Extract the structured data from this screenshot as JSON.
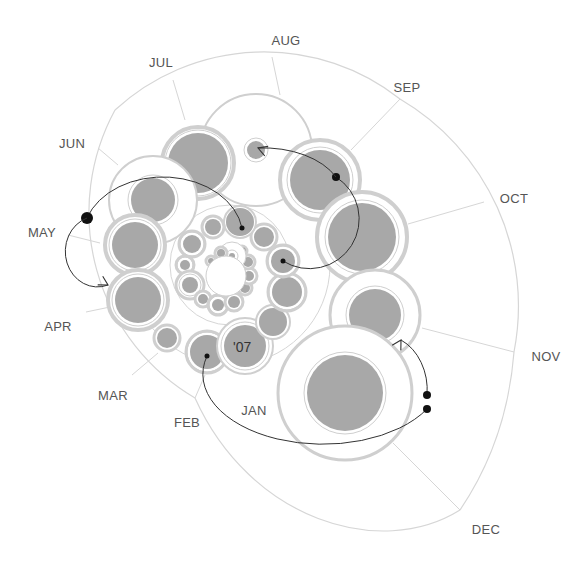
{
  "chart_data": {
    "type": "bubble-spiral",
    "title": "",
    "annotations": [
      "'07"
    ],
    "month_labels": [
      {
        "label": "AUG",
        "x": 286,
        "y": 45
      },
      {
        "label": "JUL",
        "x": 161,
        "y": 67
      },
      {
        "label": "SEP",
        "x": 407,
        "y": 92
      },
      {
        "label": "JUN",
        "x": 72,
        "y": 148
      },
      {
        "label": "OCT",
        "x": 514,
        "y": 203
      },
      {
        "label": "MAY",
        "x": 42,
        "y": 237
      },
      {
        "label": "APR",
        "x": 58,
        "y": 331
      },
      {
        "label": "NOV",
        "x": 546,
        "y": 361
      },
      {
        "label": "MAR",
        "x": 113,
        "y": 400
      },
      {
        "label": "FEB",
        "x": 187,
        "y": 427
      },
      {
        "label": "JAN",
        "x": 254,
        "y": 415
      },
      {
        "label": "DEC",
        "x": 486,
        "y": 534
      }
    ],
    "colors": {
      "fill": "#a8a8a8",
      "ring": "#cfcfcf",
      "grid": "#d6d6d6",
      "arc": "#333333",
      "dot": "#111111",
      "label": "#555555"
    },
    "outer_boundary": {
      "cx": 300,
      "cy": 260,
      "r": 225
    },
    "sector_lines": [
      {
        "x1": 280,
        "y1": 95,
        "x2": 272,
        "y2": 57
      },
      {
        "x1": 185,
        "y1": 120,
        "x2": 173,
        "y2": 80
      },
      {
        "x1": 351,
        "y1": 150,
        "x2": 400,
        "y2": 99
      },
      {
        "x1": 118,
        "y1": 165,
        "x2": 98,
        "y2": 148
      },
      {
        "x1": 408,
        "y1": 224,
        "x2": 484,
        "y2": 202
      },
      {
        "x1": 100,
        "y1": 243,
        "x2": 68,
        "y2": 235
      },
      {
        "x1": 110,
        "y1": 307,
        "x2": 86,
        "y2": 312
      },
      {
        "x1": 422,
        "y1": 328,
        "x2": 514,
        "y2": 352
      },
      {
        "x1": 158,
        "y1": 353,
        "x2": 132,
        "y2": 375
      },
      {
        "x1": 205,
        "y1": 375,
        "x2": 195,
        "y2": 398
      },
      {
        "x1": 393,
        "y1": 443,
        "x2": 460,
        "y2": 510
      }
    ],
    "bubbles": [
      {
        "cx": 256,
        "cy": 150,
        "outer": 56,
        "inner": 9,
        "ring": 2
      },
      {
        "cx": 198,
        "cy": 163,
        "outer": 36,
        "inner": 30,
        "ring": 4
      },
      {
        "cx": 153,
        "cy": 200,
        "outer": 44,
        "inner": 22,
        "ring": 2
      },
      {
        "cx": 320,
        "cy": 180,
        "outer": 40,
        "inner": 30,
        "ring": 4
      },
      {
        "cx": 135,
        "cy": 245,
        "outer": 30,
        "inner": 23,
        "ring": 4
      },
      {
        "cx": 362,
        "cy": 237,
        "outer": 45,
        "inner": 34,
        "ring": 4
      },
      {
        "cx": 138,
        "cy": 300,
        "outer": 30,
        "inner": 23,
        "ring": 4
      },
      {
        "cx": 375,
        "cy": 315,
        "outer": 45,
        "inner": 26,
        "ring": 3
      },
      {
        "cx": 167,
        "cy": 338,
        "outer": 13,
        "inner": 10,
        "ring": 3
      },
      {
        "cx": 345,
        "cy": 393,
        "outer": 67,
        "inner": 38,
        "ring": 3
      },
      {
        "cx": 207,
        "cy": 352,
        "outer": 21,
        "inner": 17,
        "ring": 3
      },
      {
        "cx": 245,
        "cy": 346,
        "outer": 28,
        "inner": 21,
        "ring": 2
      },
      {
        "cx": 273,
        "cy": 322,
        "outer": 17,
        "inner": 14,
        "ring": 2
      },
      {
        "cx": 287,
        "cy": 292,
        "outer": 19,
        "inner": 15,
        "ring": 3
      },
      {
        "cx": 283,
        "cy": 261,
        "outer": 16,
        "inner": 12,
        "ring": 3
      },
      {
        "cx": 264,
        "cy": 237,
        "outer": 13,
        "inner": 10,
        "ring": 3
      },
      {
        "cx": 240,
        "cy": 222,
        "outer": 16,
        "inner": 14,
        "ring": 2
      },
      {
        "cx": 213,
        "cy": 227,
        "outer": 11,
        "inner": 8,
        "ring": 3
      },
      {
        "cx": 192,
        "cy": 244,
        "outer": 13,
        "inner": 9,
        "ring": 3
      },
      {
        "cx": 185,
        "cy": 265,
        "outer": 9,
        "inner": 5,
        "ring": 3
      },
      {
        "cx": 190,
        "cy": 285,
        "outer": 14,
        "inner": 8,
        "ring": 3
      },
      {
        "cx": 203,
        "cy": 299,
        "outer": 8,
        "inner": 5,
        "ring": 3
      },
      {
        "cx": 218,
        "cy": 305,
        "outer": 10,
        "inner": 6,
        "ring": 3
      },
      {
        "cx": 234,
        "cy": 302,
        "outer": 9,
        "inner": 6,
        "ring": 3
      },
      {
        "cx": 245,
        "cy": 288,
        "outer": 7,
        "inner": 5,
        "ring": 3
      },
      {
        "cx": 249,
        "cy": 276,
        "outer": 8,
        "inner": 5,
        "ring": 3
      },
      {
        "cx": 248,
        "cy": 262,
        "outer": 7,
        "inner": 5,
        "ring": 3
      },
      {
        "cx": 242,
        "cy": 251,
        "outer": 5,
        "inner": 4,
        "ring": 3
      },
      {
        "cx": 232,
        "cy": 256,
        "outer": 14,
        "inner": 3,
        "ring": 1
      },
      {
        "cx": 221,
        "cy": 253,
        "outer": 6,
        "inner": 4,
        "ring": 3
      },
      {
        "cx": 211,
        "cy": 261,
        "outer": 5,
        "inner": 3,
        "ring": 3
      },
      {
        "cx": 226,
        "cy": 276,
        "outer": 20,
        "inner": 0,
        "ring": 1
      }
    ],
    "arcs": [
      {
        "d": "M 336 177 A 45 45 0 1 1 283 261",
        "dot": {
          "x": 336,
          "y": 177,
          "r": 4
        },
        "end_dot": {
          "x": 283,
          "y": 261,
          "r": 2.5
        }
      },
      {
        "d": "M 336 177 A 80 50 0 0 0 258 148",
        "arrow": {
          "x": 258,
          "y": 148,
          "angle": 200
        }
      },
      {
        "d": "M 87 218 A 80 60 0 0 1 242 228",
        "dot": {
          "x": 87,
          "y": 218,
          "r": 6
        },
        "end_dot": {
          "x": 242,
          "y": 228,
          "r": 2.5
        }
      },
      {
        "d": "M 87 218 A 30 33 0 0 0 108 285",
        "arrow": {
          "x": 108,
          "y": 285,
          "angle": 30
        }
      },
      {
        "d": "M 427 409 A 120 70 0 0 1 207 356",
        "dot": {
          "x": 427,
          "y": 409,
          "r": 4
        },
        "end_dot": {
          "x": 207,
          "y": 356,
          "r": 2.5
        }
      },
      {
        "d": "M 427 395 A 45 55 0 0 0 401 340",
        "dot": {
          "x": 427,
          "y": 395,
          "r": 4
        },
        "arrow": {
          "x": 401,
          "y": 340,
          "angle": 300
        }
      }
    ]
  }
}
